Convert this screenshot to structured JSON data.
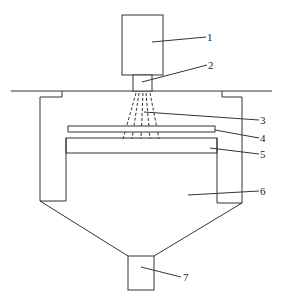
{
  "figure": {
    "type": "patent-schematic"
  },
  "labels": [
    {
      "id": "1",
      "text": "1",
      "x": 262,
      "y": 41
    },
    {
      "id": "2",
      "text": "2",
      "x": 262,
      "y": 68
    },
    {
      "id": "3",
      "text": "3",
      "x": 262,
      "y": 124
    },
    {
      "id": "4",
      "text": "4",
      "x": 262,
      "y": 142
    },
    {
      "id": "5",
      "text": "5",
      "x": 262,
      "y": 158
    },
    {
      "id": "6",
      "text": "6",
      "x": 262,
      "y": 195
    },
    {
      "id": "7",
      "text": "7",
      "x": 184,
      "y": 281
    }
  ]
}
